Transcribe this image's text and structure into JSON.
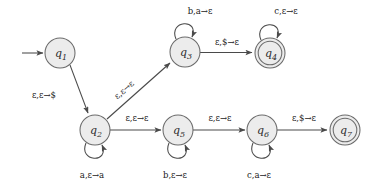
{
  "diagram": {
    "type": "pushdown-automaton-state-diagram",
    "title": "",
    "width": 378,
    "height": 190,
    "colors": {
      "state_fill": "#ececec",
      "state_stroke": "#6b6b6b",
      "edge_stroke": "#4a4a4a",
      "text": "#1a1a1a",
      "background": "#ffffff"
    },
    "start_state": "q1",
    "accept_states": [
      "q4",
      "q7"
    ],
    "states": [
      {
        "id": "q1",
        "label": "q",
        "sub": "1",
        "cx": 60,
        "cy": 53,
        "r": 15,
        "accepting": false
      },
      {
        "id": "q2",
        "label": "q",
        "sub": "2",
        "cx": 95,
        "cy": 130,
        "r": 15,
        "accepting": false
      },
      {
        "id": "q3",
        "label": "q",
        "sub": "3",
        "cx": 185,
        "cy": 52,
        "r": 15,
        "accepting": false
      },
      {
        "id": "q4",
        "label": "q",
        "sub": "4",
        "cx": 270,
        "cy": 53,
        "r": 15,
        "accepting": true
      },
      {
        "id": "q5",
        "label": "q",
        "sub": "5",
        "cx": 178,
        "cy": 130,
        "r": 15,
        "accepting": false
      },
      {
        "id": "q6",
        "label": "q",
        "sub": "6",
        "cx": 262,
        "cy": 130,
        "r": 15,
        "accepting": false
      },
      {
        "id": "q7",
        "label": "q",
        "sub": "7",
        "cx": 345,
        "cy": 130,
        "r": 15,
        "accepting": true
      }
    ],
    "start_arrow": {
      "from_x": 22,
      "to_x": 43,
      "y": 53
    },
    "transitions": [
      {
        "id": "t1",
        "from": "q1",
        "to": "q2",
        "read": "ε",
        "pop": "ε",
        "push": "$",
        "label": "ε,ε→$",
        "label_x": 44,
        "label_y": 98,
        "kind": "edge"
      },
      {
        "id": "t2",
        "from": "q2",
        "to": "q3",
        "read": "ε",
        "pop": "ε",
        "push": "ε",
        "label": "ε,ε→ε",
        "label_x": 126,
        "label_y": 92,
        "kind": "edge"
      },
      {
        "id": "t3",
        "from": "q3",
        "to": "q4",
        "read": "ε",
        "pop": "$",
        "push": "ε",
        "label": "ε,$→ε",
        "label_x": 227,
        "label_y": 45,
        "kind": "edge"
      },
      {
        "id": "t4",
        "from": "q2",
        "to": "q5",
        "read": "ε",
        "pop": "ε",
        "push": "ε",
        "label": "ε,ε→ε",
        "label_x": 137,
        "label_y": 120,
        "kind": "edge"
      },
      {
        "id": "t5",
        "from": "q5",
        "to": "q6",
        "read": "ε",
        "pop": "ε",
        "push": "ε",
        "label": "ε,ε→ε",
        "label_x": 220,
        "label_y": 120,
        "kind": "edge"
      },
      {
        "id": "t6",
        "from": "q6",
        "to": "q7",
        "read": "ε",
        "pop": "$",
        "push": "ε",
        "label": "ε,$→ε",
        "label_x": 304,
        "label_y": 120,
        "kind": "edge"
      },
      {
        "id": "t7",
        "from": "q3",
        "to": "q3",
        "read": "b",
        "pop": "a",
        "push": "ε",
        "label": "b,a→ε",
        "label_x": 200,
        "label_y": 14,
        "kind": "self-loop"
      },
      {
        "id": "t8",
        "from": "q4",
        "to": "q4",
        "read": "c",
        "pop": "ε",
        "push": "ε",
        "label": "c,ε→ε",
        "label_x": 285,
        "label_y": 14,
        "kind": "self-loop"
      },
      {
        "id": "t9",
        "from": "q2",
        "to": "q2",
        "read": "a",
        "pop": "ε",
        "push": "a",
        "label": "a,ε→a",
        "label_x": 95,
        "label_y": 176,
        "kind": "self-loop"
      },
      {
        "id": "t10",
        "from": "q5",
        "to": "q5",
        "read": "b",
        "pop": "ε",
        "push": "ε",
        "label": "b,ε→ε",
        "label_x": 178,
        "label_y": 176,
        "kind": "self-loop"
      },
      {
        "id": "t11",
        "from": "q6",
        "to": "q6",
        "read": "c",
        "pop": "a",
        "push": "ε",
        "label": "c,a→ε",
        "label_x": 262,
        "label_y": 176,
        "kind": "self-loop"
      }
    ]
  }
}
